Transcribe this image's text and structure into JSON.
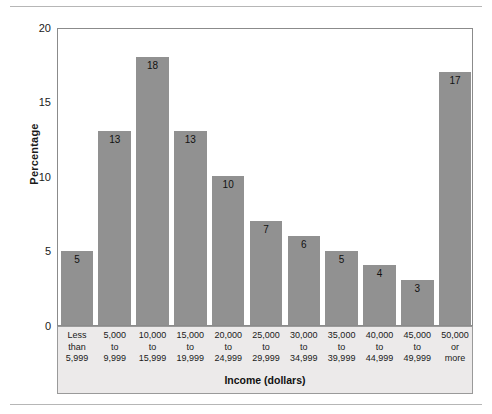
{
  "chart_data": {
    "type": "bar",
    "title": "",
    "xlabel": "Income (dollars)",
    "ylabel": "Percentage",
    "ylim": [
      0,
      20
    ],
    "yticks": [
      0,
      5,
      10,
      15,
      20
    ],
    "grid": false,
    "legend": "none",
    "bar_color": "#919191",
    "categories": [
      "Less than 5,999",
      "5,000 to 9,999",
      "10,000 to 15,999",
      "15,000 to 19,999",
      "20,000 to 24,999",
      "25,000 to 29,999",
      "30,000 to 34,999",
      "35,000 to 39,999",
      "40,000 to 44,999",
      "45,000 to 49,999",
      "50,000 or more"
    ],
    "category_lines": [
      [
        "Less",
        "than",
        "5,999"
      ],
      [
        "5,000",
        "to",
        "9,999"
      ],
      [
        "10,000",
        "to",
        "15,999"
      ],
      [
        "15,000",
        "to",
        "19,999"
      ],
      [
        "20,000",
        "to",
        "24,999"
      ],
      [
        "25,000",
        "to",
        "29,999"
      ],
      [
        "30,000",
        "to",
        "34,999"
      ],
      [
        "35,000",
        "to",
        "39,999"
      ],
      [
        "40,000",
        "to",
        "44,999"
      ],
      [
        "45,000",
        "to",
        "49,999"
      ],
      [
        "50,000",
        "or",
        "more"
      ]
    ],
    "values": [
      5,
      13,
      18,
      13,
      10,
      7,
      6,
      5,
      4,
      3,
      17
    ],
    "value_labels": [
      "5",
      "13",
      "18",
      "13",
      "10",
      "7",
      "6",
      "5",
      "4",
      "3",
      "17"
    ]
  }
}
